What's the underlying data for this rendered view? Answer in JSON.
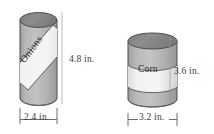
{
  "figure": {
    "background": "#ffffff",
    "objects": [
      {
        "name": "onions-can",
        "shape": "cylinder",
        "label": "Onions",
        "label_orientation": "diagonal",
        "height_label": "4.8 in.",
        "diameter_label": "2.4 in.",
        "height_value": 4.8,
        "diameter_value": 2.4,
        "units": "in.",
        "body_color": "#b3b3b3",
        "top_color": "#8a8a8a",
        "band_color": "#efefef",
        "outline_color": "#4d4d4d"
      },
      {
        "name": "corn-can",
        "shape": "cylinder",
        "label": "Corn",
        "label_orientation": "horizontal",
        "height_label": "3.6 in.",
        "diameter_label": "3.2 in.",
        "height_value": 3.6,
        "diameter_value": 3.2,
        "units": "in.",
        "body_color": "#b3b3b3",
        "top_color": "#8a8a8a",
        "band_color": "#efefef",
        "outline_color": "#4d4d4d"
      }
    ],
    "dimension_line_color": "#6e6e6e"
  }
}
